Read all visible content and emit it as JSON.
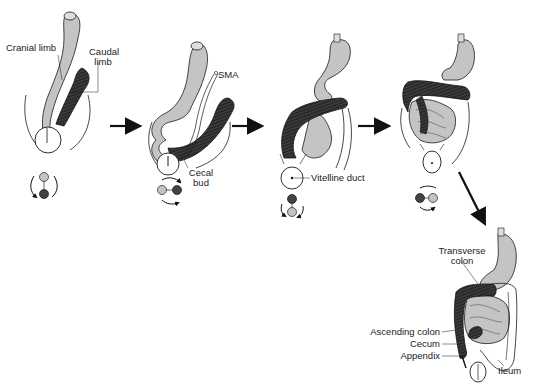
{
  "diagram": {
    "type": "embryology-sequence",
    "colors": {
      "cranial_limb": "#c4c4c4",
      "caudal_limb": "#3a3a3a",
      "outline": "#1a1a1a",
      "background": "#ffffff"
    },
    "stages": [
      {
        "id": "stage-1",
        "labels": {
          "cranial": "Cranial limb",
          "caudal_line1": "Caudal",
          "caudal_line2": "limb"
        },
        "rotation_indicator": {
          "top": "light",
          "bottom": "dark"
        }
      },
      {
        "id": "stage-2",
        "labels": {
          "sma": "SMA",
          "cecal_line1": "Cecal",
          "cecal_line2": "bud"
        },
        "rotation_indicator": {
          "left": "light",
          "right": "dark"
        }
      },
      {
        "id": "stage-3",
        "labels": {
          "vitelline": "Vitelline duct"
        },
        "rotation_indicator": {
          "top": "dark",
          "bottom": "light"
        }
      },
      {
        "id": "stage-4",
        "labels": {},
        "rotation_indicator": {
          "left": "dark",
          "right": "light"
        }
      },
      {
        "id": "stage-5",
        "labels": {
          "transverse_line1": "Transverse",
          "transverse_line2": "colon",
          "ascending": "Ascending colon",
          "cecum": "Cecum",
          "appendix": "Appendix",
          "ileum": "Ileum"
        }
      }
    ],
    "arrows": [
      {
        "from": "stage-1",
        "to": "stage-2",
        "direction": "right"
      },
      {
        "from": "stage-2",
        "to": "stage-3",
        "direction": "right"
      },
      {
        "from": "stage-3",
        "to": "stage-4",
        "direction": "right"
      },
      {
        "from": "stage-4",
        "to": "stage-5",
        "direction": "down-right"
      }
    ]
  }
}
